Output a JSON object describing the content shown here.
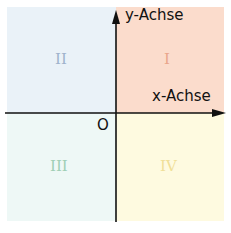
{
  "diagram": {
    "axes": {
      "y_label": "y-Achse",
      "x_label": "x-Achse",
      "origin_label": "O"
    },
    "quadrants": [
      {
        "id": "I",
        "label": "I",
        "bg": "#fbdccc",
        "text_color": "#e9a58a"
      },
      {
        "id": "II",
        "label": "II",
        "bg": "#eaf2f8",
        "text_color": "#9fb3cc"
      },
      {
        "id": "III",
        "label": "III",
        "bg": "#eef8f6",
        "text_color": "#9fcfb5"
      },
      {
        "id": "IV",
        "label": "IV",
        "bg": "#fefae0",
        "text_color": "#f0df98"
      }
    ],
    "axis_color": "#111111"
  }
}
